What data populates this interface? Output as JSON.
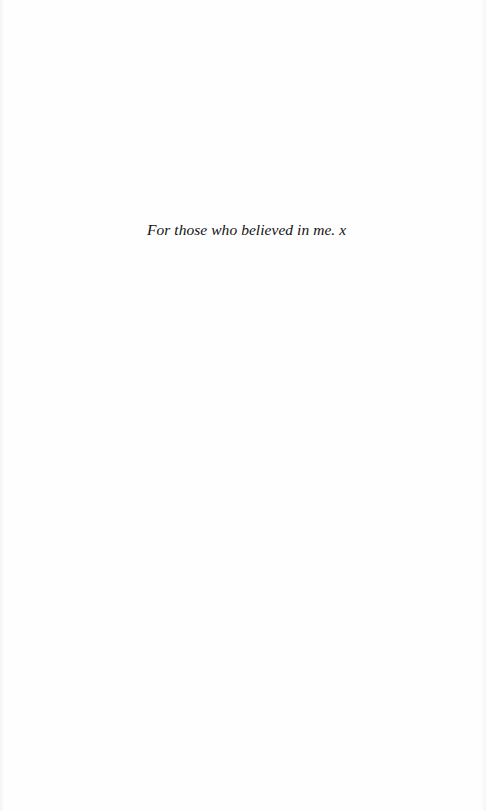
{
  "page": {
    "type": "dedication",
    "dedication_text": "For those who believed in me. x"
  }
}
